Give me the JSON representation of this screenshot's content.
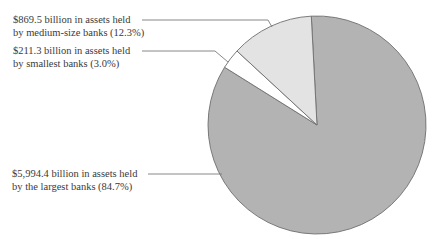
{
  "chart_data": {
    "type": "pie",
    "title": "",
    "categories": [
      "Largest banks",
      "Smallest banks",
      "Medium-size banks"
    ],
    "values": [
      5994.4,
      211.3,
      869.5
    ],
    "percentages": [
      84.7,
      3.0,
      12.3
    ],
    "units": "billion dollars in assets",
    "colors": [
      "#b3b3b3",
      "#ffffff",
      "#e3e3e3"
    ],
    "annotations": [
      {
        "line1": "$869.5 billion in assets held",
        "line2": "by medium-size banks (12.3%)"
      },
      {
        "line1": "$211.3 billion in assets held",
        "line2": "by smallest banks (3.0%)"
      },
      {
        "line1": "$5,994.4 billion in assets held",
        "line2": "by the largest banks (84.7%)"
      }
    ],
    "legend": "none (leader-line labels)"
  }
}
